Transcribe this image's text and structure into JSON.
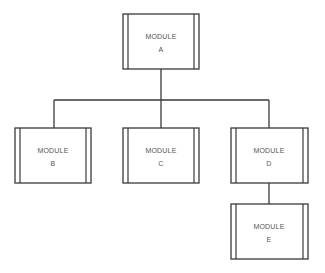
{
  "diagram": {
    "type": "hierarchy chart",
    "nodes": [
      {
        "id": "A",
        "line1": "MODULE",
        "line2": "A"
      },
      {
        "id": "B",
        "line1": "MODULE",
        "line2": "B"
      },
      {
        "id": "C",
        "line1": "MODULE",
        "line2": "C"
      },
      {
        "id": "D",
        "line1": "MODULE",
        "line2": "D"
      },
      {
        "id": "E",
        "line1": "MODULE",
        "line2": "E"
      }
    ],
    "edges": [
      {
        "from": "A",
        "to": "B"
      },
      {
        "from": "A",
        "to": "C"
      },
      {
        "from": "A",
        "to": "D"
      },
      {
        "from": "D",
        "to": "E"
      }
    ]
  }
}
